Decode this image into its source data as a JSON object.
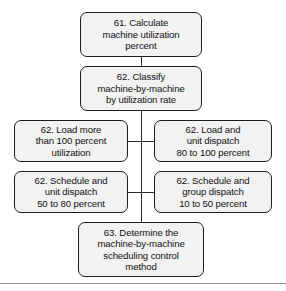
{
  "diagram": {
    "type": "flowchart",
    "orientation": "vertical",
    "nodes": {
      "calculate": "61. Calculate\nmachine utilization\npercent",
      "classify": "62. Classify\nmachine-by-machine\nby utilization rate",
      "load_more_than_100": "62. Load more\nthan 100 percent\nutilization",
      "load_and_unit_dispatch": "62. Load and\nunit dispatch\n80 to 100 percent",
      "schedule_and_unit_dispatch": "62. Schedule and\nunit dispatch\n50 to 80 percent",
      "schedule_and_group_dispatch": "62. Schedule and\ngroup dispatch\n10 to 50 percent",
      "determine": "63. Determine the\nmachine-by-machine\nscheduling control\nmethod"
    },
    "colors": {
      "box_fill": "#f2f2f2",
      "box_border": "#1d1d1d",
      "connector": "#2b2b2b",
      "text": "#111111",
      "footer_rule": "#9a9a9a",
      "background": "#ffffff"
    }
  }
}
